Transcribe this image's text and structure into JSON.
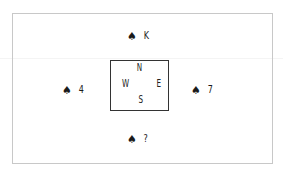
{
  "diagram": {
    "type": "bridge-hand-layout",
    "compass": {
      "north": "N",
      "west": "W",
      "east": "E",
      "south": "S"
    },
    "hands": {
      "north": {
        "suit_icon": "spade-icon",
        "suit_glyph": "♠",
        "card": "K"
      },
      "west": {
        "suit_icon": "spade-icon",
        "suit_glyph": "♠",
        "card": "4"
      },
      "east": {
        "suit_icon": "spade-icon",
        "suit_glyph": "♠",
        "card": "7"
      },
      "south": {
        "suit_icon": "spade-icon",
        "suit_glyph": "♠",
        "card": "?"
      }
    },
    "colors": {
      "frame_border": "#c8c8c8",
      "compass_border": "#333333",
      "text": "#1a1a1a"
    }
  }
}
